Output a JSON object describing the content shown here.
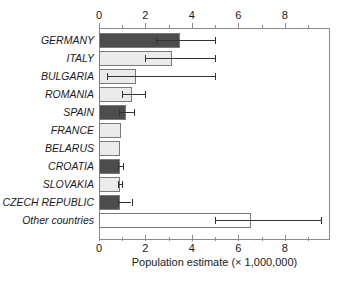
{
  "chart_data": {
    "type": "bar",
    "orientation": "horizontal",
    "title": "",
    "xlabel": "Population estimate (× 1,000,000)",
    "ylabel": "",
    "xlim": [
      0,
      9.95
    ],
    "xticks": [
      0,
      2,
      4,
      6,
      8
    ],
    "xtick_labels": [
      "0",
      "2",
      "4",
      "6",
      "8"
    ],
    "xticks_minor": [
      1,
      3,
      5,
      7,
      9
    ],
    "grid": false,
    "legend": "none",
    "axis_top_labels": true,
    "axis_bottom_labels": true,
    "categories": [
      "GERMANY",
      "ITALY",
      "BULGARIA",
      "ROMANIA",
      "SPAIN",
      "FRANCE",
      "BELARUS",
      "CROATIA",
      "SLOVAKIA",
      "CZECH REPUBLIC",
      "Other countries"
    ],
    "values": [
      3.5,
      3.15,
      1.6,
      1.4,
      1.15,
      0.95,
      0.9,
      0.9,
      0.9,
      0.9,
      6.55
    ],
    "error_low": [
      2.45,
      2.0,
      0.35,
      1.0,
      0.85,
      null,
      null,
      0.82,
      0.82,
      0.8,
      5.0
    ],
    "error_high": [
      5.0,
      5.0,
      5.0,
      2.0,
      1.5,
      null,
      null,
      1.05,
      1.0,
      1.4,
      9.55
    ],
    "bar_fills": [
      "#4d4d4d",
      "#ebebeb",
      "#ebebeb",
      "#ebebeb",
      "#4d4d4d",
      "#ebebeb",
      "#ebebeb",
      "#4d4d4d",
      "#ebebeb",
      "#4d4d4d",
      "#ffffff"
    ],
    "colors": {
      "dark_bar": "#4d4d4d",
      "light_bar": "#ebebeb",
      "white_bar": "#ffffff",
      "bar_outline": "#7a7a7a",
      "axis": "#8c8c8c",
      "error_bar": "#333333",
      "text": "#1a1a1a"
    }
  }
}
